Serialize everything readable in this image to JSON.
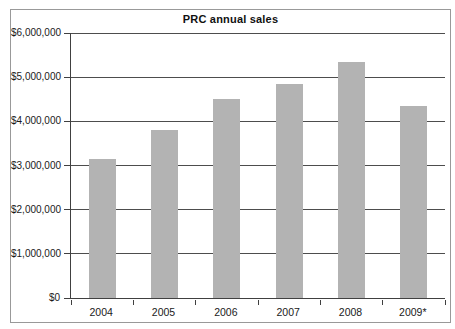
{
  "chart": {
    "title": "PRC annual sales"
  },
  "chart_data": {
    "type": "bar",
    "title": "PRC annual sales",
    "categories": [
      "2004",
      "2005",
      "2006",
      "2007",
      "2008",
      "2009*"
    ],
    "values": [
      3150000,
      3800000,
      4500000,
      4850000,
      5350000,
      4350000
    ],
    "xlabel": "",
    "ylabel": "",
    "ylim": [
      0,
      6000000
    ],
    "y_tick_step": 1000000,
    "y_tick_labels": [
      "$0",
      "$1,000,000",
      "$2,000,000",
      "$3,000,000",
      "$4,000,000",
      "$5,000,000",
      "$6,000,000"
    ],
    "grid": "horizontal",
    "legend": "none",
    "bar_color": "#b3b3b3",
    "gridline_color": "#4d4d4d",
    "axis_color": "#404040",
    "frame_border_color": "#999999",
    "background_color": "#ffffff"
  }
}
